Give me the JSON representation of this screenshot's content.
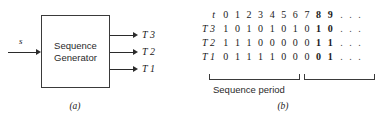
{
  "figure": {
    "panel_a": {
      "caption": "(a)",
      "block_label": "Sequence\nGenerator",
      "input": {
        "label": "s",
        "name": "input-s"
      },
      "outputs": [
        {
          "label": "T 3"
        },
        {
          "label": "T 2"
        },
        {
          "label": "T 1"
        }
      ]
    },
    "panel_b": {
      "caption": "(b)",
      "period_caption": "Sequence period",
      "ellipsis": [
        ".",
        ".",
        "."
      ],
      "rows": [
        {
          "label": "t",
          "cells": [
            "0",
            "1",
            "2",
            "3",
            "4",
            "5",
            "6",
            "7",
            "8",
            "9"
          ],
          "bold_from": 8
        },
        {
          "label": "T 3",
          "cells": [
            "1",
            "0",
            "1",
            "0",
            "1",
            "0",
            "1",
            "0",
            "1",
            "0"
          ],
          "bold_from": 8
        },
        {
          "label": "T 2",
          "cells": [
            "1",
            "1",
            "1",
            "0",
            "0",
            "0",
            "0",
            "0",
            "1",
            "1"
          ],
          "bold_from": 8
        },
        {
          "label": "T 1",
          "cells": [
            "0",
            "1",
            "1",
            "1",
            "1",
            "0",
            "0",
            "0",
            "0",
            "1"
          ],
          "bold_from": 8
        }
      ]
    }
  },
  "chart_data": {
    "type": "table",
    "xlabel": "t",
    "ylabel": "",
    "categories": [
      "0",
      "1",
      "2",
      "3",
      "4",
      "5",
      "6",
      "7",
      "8",
      "9"
    ],
    "series": [
      {
        "name": "T 3",
        "values": [
          1,
          0,
          1,
          0,
          1,
          0,
          1,
          0,
          1,
          0
        ]
      },
      {
        "name": "T 2",
        "values": [
          1,
          1,
          1,
          0,
          0,
          0,
          0,
          0,
          1,
          1
        ]
      },
      {
        "name": "T 1",
        "values": [
          0,
          1,
          1,
          1,
          1,
          0,
          0,
          0,
          0,
          1
        ]
      }
    ],
    "annotations": [
      "Sequence period"
    ],
    "grid": false,
    "legend": "none"
  },
  "colors": {
    "stroke": "#3a3a3a",
    "wire": "#2b2b2b",
    "text": "#1a1a1a",
    "background": "#ffffff"
  }
}
